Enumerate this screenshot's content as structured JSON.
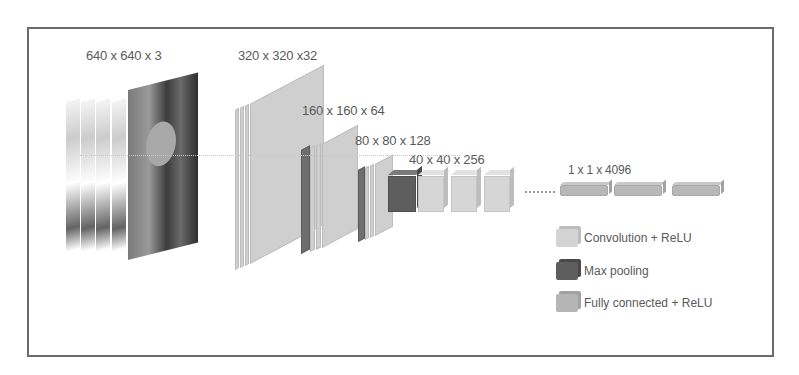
{
  "diagram": {
    "type": "cnn-architecture",
    "layers": [
      {
        "id": "input",
        "label": "640 x 640 x 3",
        "kind": "input-image"
      },
      {
        "id": "conv1",
        "label": "320 x 320 x32",
        "kind": "convolution"
      },
      {
        "id": "conv2",
        "label": "160 x 160 x 64",
        "kind": "convolution+maxpool"
      },
      {
        "id": "conv3",
        "label": "80 x 80 x 128",
        "kind": "convolution+maxpool"
      },
      {
        "id": "conv4",
        "label": "40 x 40 x 256",
        "kind": "convolution+maxpool"
      },
      {
        "id": "fc",
        "label": "1 x 1 x 4096",
        "kind": "fully-connected"
      }
    ],
    "legend": [
      {
        "label": "Convolution + ReLU",
        "color": "#d4d4d4"
      },
      {
        "label": "Max pooling",
        "color": "#5e5e5e"
      },
      {
        "label": "Fully connected + ReLU",
        "color": "#b5b5b5"
      }
    ],
    "colors": {
      "frame": "#6a6a6a",
      "conv": "#d4d4d4",
      "pool": "#5e5e5e",
      "fc": "#b5b5b5",
      "text": "#5a5a5a"
    }
  }
}
